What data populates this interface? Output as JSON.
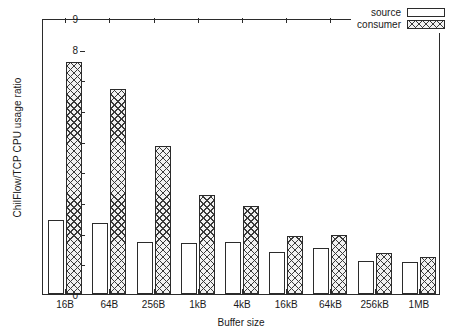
{
  "chart_data": {
    "type": "bar",
    "title": "",
    "xlabel": "Buffer size",
    "ylabel": "ChilFlow/TCP CPU usage ratio",
    "categories": [
      "16B",
      "64B",
      "256B",
      "1kB",
      "4kB",
      "16kB",
      "64kB",
      "256kB",
      "1MB"
    ],
    "series": [
      {
        "name": "source",
        "values": [
          2.42,
          2.3,
          1.68,
          1.66,
          1.68,
          1.36,
          1.49,
          1.08,
          1.04
        ]
      },
      {
        "name": "consumer",
        "values": [
          7.57,
          6.7,
          4.82,
          3.23,
          2.88,
          1.9,
          1.94,
          1.34,
          1.22
        ]
      }
    ],
    "ylim": [
      0,
      9
    ],
    "yticks": [
      "0",
      "1",
      "2",
      "3",
      "4",
      "5",
      "6",
      "7",
      "8",
      "9"
    ],
    "grid": false,
    "legend_position": "top-right"
  },
  "legend": {
    "source_label": "source",
    "consumer_label": "consumer"
  }
}
